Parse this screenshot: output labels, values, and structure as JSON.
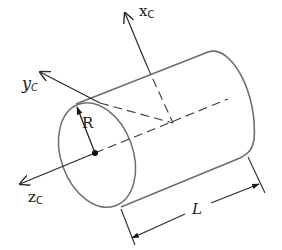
{
  "figure": {
    "labels": {
      "x_axis": {
        "main": "x",
        "sub": "C"
      },
      "y_axis": {
        "main": "y",
        "sub": "C"
      },
      "z_axis": {
        "main": "z",
        "sub": "C"
      },
      "radius": "R",
      "length": "L"
    },
    "colors": {
      "outline": "#6e6e6e",
      "axis": "#2a2a2a",
      "text": "#1a1a1a"
    }
  }
}
